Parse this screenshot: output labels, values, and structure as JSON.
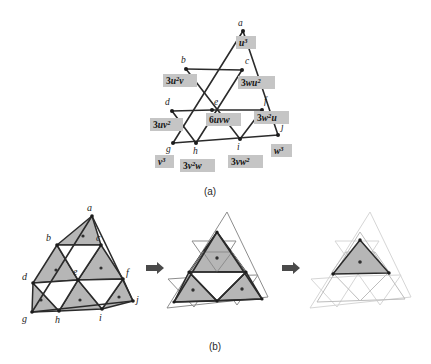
{
  "figure": {
    "title_visible": false,
    "panels": [
      {
        "id": "a",
        "caption": "(a)"
      },
      {
        "id": "b",
        "caption": "(b)"
      }
    ]
  },
  "panel_a": {
    "caption": "(a)",
    "vertices": [
      {
        "id": "a",
        "label": "a",
        "x": 243,
        "y": 31,
        "lx": 238,
        "ly": 26
      },
      {
        "id": "b",
        "label": "b",
        "x": 186,
        "y": 69,
        "lx": 181,
        "ly": 63
      },
      {
        "id": "c",
        "label": "c",
        "x": 242,
        "y": 70,
        "lx": 245,
        "ly": 64
      },
      {
        "id": "d",
        "label": "d",
        "x": 172,
        "y": 111,
        "lx": 166,
        "ly": 105
      },
      {
        "id": "e",
        "label": "e",
        "x": 212,
        "y": 110,
        "lx": 214,
        "ly": 104
      },
      {
        "id": "f",
        "label": "f",
        "x": 262,
        "y": 110,
        "lx": 264,
        "ly": 103
      },
      {
        "id": "g",
        "label": "g",
        "x": 173,
        "y": 143,
        "lx": 168,
        "ly": 150
      },
      {
        "id": "h",
        "label": "h",
        "x": 196,
        "y": 143,
        "lx": 193,
        "ly": 152
      },
      {
        "id": "i",
        "label": "i",
        "x": 240,
        "y": 139,
        "lx": 237,
        "ly": 148
      },
      {
        "id": "j",
        "label": "j",
        "x": 278,
        "y": 135,
        "lx": 281,
        "ly": 130
      }
    ],
    "terms": [
      {
        "vertex": "a",
        "coef": "",
        "base": "u",
        "exp": "3",
        "text": "u³",
        "x": 236,
        "y": 36,
        "w": 20,
        "h": 13
      },
      {
        "vertex": "b",
        "coef": "3",
        "base": "u",
        "exp": "2",
        "text": "3u²v",
        "x": 163,
        "y": 74,
        "w": 33,
        "h": 13
      },
      {
        "vertex": "c",
        "coef": "3",
        "base": "wu",
        "exp": "2",
        "text": "3wu²",
        "x": 238,
        "y": 76,
        "w": 36,
        "h": 13
      },
      {
        "vertex": "d",
        "coef": "3",
        "base": "uv",
        "exp": "2",
        "text": "3uv²",
        "x": 150,
        "y": 118,
        "w": 32,
        "h": 13
      },
      {
        "vertex": "e",
        "coef": "6",
        "base": "uvw",
        "exp": "",
        "text": "6uvw",
        "x": 207,
        "y": 113,
        "w": 33,
        "h": 13
      },
      {
        "vertex": "f",
        "coef": "3",
        "base": "w",
        "exp": "2",
        "text": "3w²u",
        "x": 255,
        "y": 111,
        "w": 34,
        "h": 13
      },
      {
        "vertex": "g",
        "coef": "",
        "base": "v",
        "exp": "3",
        "text": "v³",
        "x": 155,
        "y": 155,
        "w": 19,
        "h": 13
      },
      {
        "vertex": "h",
        "coef": "3",
        "base": "v",
        "exp": "2",
        "text": "3v²w",
        "x": 180,
        "y": 159,
        "w": 34,
        "h": 13
      },
      {
        "vertex": "i",
        "coef": "3",
        "base": "vw",
        "exp": "2",
        "text": "3vw²",
        "x": 228,
        "y": 155,
        "w": 34,
        "h": 13
      },
      {
        "vertex": "j",
        "coef": "",
        "base": "w",
        "exp": "3",
        "text": "w³",
        "x": 271,
        "y": 144,
        "w": 21,
        "h": 13
      }
    ]
  },
  "panel_b": {
    "caption": "(b)",
    "steps": [
      {
        "id": "step-1",
        "name": "initial-subdivision"
      },
      {
        "id": "step-2",
        "name": "first-iteration"
      },
      {
        "id": "step-3",
        "name": "second-iteration"
      }
    ],
    "vertices": [
      {
        "id": "a",
        "label": "a",
        "lx": 87,
        "ly": 211
      },
      {
        "id": "b",
        "label": "b",
        "lx": 47,
        "ly": 240
      },
      {
        "id": "c",
        "label": "c",
        "lx": 94,
        "ly": 241
      },
      {
        "id": "d",
        "label": "d",
        "lx": 24,
        "ly": 277
      },
      {
        "id": "e",
        "label": "e",
        "lx": 73,
        "ly": 272
      },
      {
        "id": "f",
        "label": "f",
        "lx": 118,
        "ly": 272
      },
      {
        "id": "g",
        "label": "g",
        "lx": 24,
        "ly": 317
      },
      {
        "id": "h",
        "label": "h",
        "lx": 52,
        "ly": 322
      },
      {
        "id": "i",
        "label": "i",
        "lx": 97,
        "ly": 320
      },
      {
        "id": "j",
        "label": "j",
        "lx": 134,
        "ly": 305
      }
    ],
    "arrows": [
      {
        "id": "arrow-1",
        "x": 142,
        "y": 268
      },
      {
        "id": "arrow-2",
        "x": 278,
        "y": 268
      }
    ]
  },
  "colors": {
    "label_box": "#c5c5c5",
    "triangle_fill": "#b6b6b6",
    "edge_dark": "#2b2b2b",
    "edge_light": "#8d8d8d",
    "edge_faint": "#bdbdbd",
    "background": "#ffffff"
  }
}
